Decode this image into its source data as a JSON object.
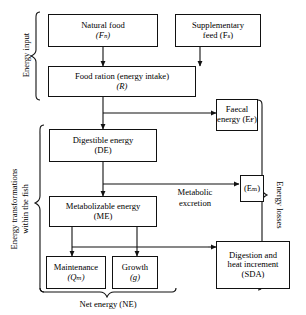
{
  "diagram": {
    "type": "flow-diagram",
    "boxes": {
      "natural_food": {
        "line1": "Natural food",
        "line2": "(Fₙ)"
      },
      "supplementary_feed": {
        "line1": "Supplementary",
        "line2": "feed (Fₛ)"
      },
      "food_ration": {
        "line1": "Food ration (energy intake)",
        "line2": "(R)"
      },
      "faecal_energy": {
        "line1": "Faecal",
        "line2": "energy (Eғ)"
      },
      "digestible_energy": {
        "line1": "Digestible energy",
        "line2": "(DE)"
      },
      "metabolizable_energy": {
        "line1": "Metabolizable energy",
        "line2": "(ME)"
      },
      "metabolic_excretion_box": {
        "line1": "(Eₘ)",
        "line2": ""
      },
      "maintenance": {
        "line1": "Maintenance",
        "line2": "(Qₘ)"
      },
      "growth": {
        "line1": "Growth",
        "line2": "(g)"
      },
      "sda": {
        "line1": "Digestion and",
        "line2": "heat increment",
        "line3": "(SDA)"
      }
    },
    "labels": {
      "energy_input": "Energy input",
      "energy_transformations_1": "Energy transformations",
      "energy_transformations_2": "within the fish",
      "energy_losses": "Energy losses",
      "metabolic_excretion_1": "Metabolic",
      "metabolic_excretion_2": "excretion",
      "net_energy": "Net energy (NE)"
    },
    "colors": {
      "stroke": "#111111",
      "background": "#ffffff",
      "text": "#000000"
    }
  }
}
